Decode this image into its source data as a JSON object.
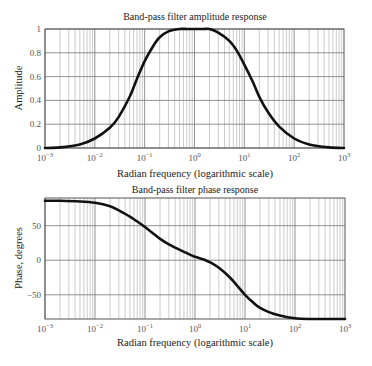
{
  "chart_data": [
    {
      "type": "line",
      "title": "Band-pass filter amplitude response",
      "xlabel": "Radian frequency (logarithmic scale)",
      "ylabel": "Amplitude",
      "xscale": "log",
      "xlim": [
        0.001,
        1000
      ],
      "ylim": [
        0,
        1
      ],
      "grid": true,
      "xticks": [
        "10^-3",
        "10^-2",
        "10^-1",
        "10^0",
        "10^1",
        "10^2",
        "10^3"
      ],
      "yticks": [
        "0",
        "0.2",
        "0.4",
        "0.6",
        "0.8",
        "1"
      ],
      "series": [
        {
          "name": "Amplitude",
          "x": [
            0.001,
            0.002,
            0.005,
            0.01,
            0.02,
            0.03,
            0.05,
            0.07,
            0.1,
            0.15,
            0.2,
            0.3,
            0.5,
            0.7,
            1,
            1.5,
            2,
            3,
            5,
            7,
            10,
            15,
            20,
            30,
            50,
            100,
            200,
            500,
            1000
          ],
          "values": [
            0.0,
            0.005,
            0.03,
            0.08,
            0.17,
            0.26,
            0.43,
            0.58,
            0.73,
            0.86,
            0.93,
            0.98,
            1.0,
            1.0,
            1.0,
            1.0,
            1.0,
            0.97,
            0.9,
            0.82,
            0.7,
            0.55,
            0.43,
            0.3,
            0.18,
            0.08,
            0.03,
            0.005,
            0.0
          ]
        }
      ]
    },
    {
      "type": "line",
      "title": "Band-pass filter phase response",
      "xlabel": "Radian frequency (logarithmic scale)",
      "ylabel": "Phase, degrees",
      "xscale": "log",
      "xlim": [
        0.001,
        1000
      ],
      "ylim": [
        -85,
        90
      ],
      "grid": true,
      "xticks": [
        "10^-3",
        "10^-2",
        "10^-1",
        "10^0",
        "10^1",
        "10^2",
        "10^3"
      ],
      "yticks": [
        "50",
        "0",
        "-50"
      ],
      "series": [
        {
          "name": "Phase",
          "x": [
            0.001,
            0.002,
            0.005,
            0.01,
            0.02,
            0.03,
            0.05,
            0.07,
            0.1,
            0.15,
            0.2,
            0.3,
            0.5,
            0.7,
            1,
            1.5,
            2,
            3,
            5,
            7,
            10,
            15,
            20,
            30,
            50,
            100,
            200,
            500,
            1000
          ],
          "values": [
            86,
            86,
            85,
            83,
            78,
            72,
            63,
            56,
            48,
            38,
            31,
            23,
            15,
            10,
            5,
            1,
            -3,
            -11,
            -25,
            -37,
            -50,
            -62,
            -69,
            -75,
            -80,
            -84,
            -85,
            -85,
            -85
          ]
        }
      ]
    }
  ],
  "labels": {
    "amp_title": "Band-pass filter amplitude response",
    "amp_ylabel": "Amplitude",
    "amp_xlabel": "Radian frequency (logarithmic scale)",
    "phase_title": "Band-pass filter phase response",
    "phase_ylabel": "Phase, degrees",
    "phase_xlabel": "Radian frequency (logarithmic scale)",
    "amp_yticks": [
      "0",
      "0.2",
      "0.4",
      "0.6",
      "0.8",
      "1"
    ],
    "phase_yticks": [
      "50",
      "0",
      "-50"
    ],
    "xtick_base": "10",
    "xtick_exps": [
      "−3",
      "−2",
      "−1",
      "0",
      "1",
      "2",
      "3"
    ]
  }
}
